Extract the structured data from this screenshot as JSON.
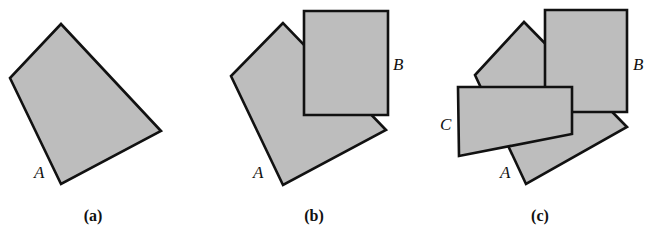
{
  "panels": [
    {
      "caption": "(a)",
      "shapes": [
        {
          "label": "A",
          "points": "61,24 10,78 61,184 161,131"
        }
      ],
      "labels": [
        {
          "text": "A",
          "x": 34,
          "y": 178
        }
      ]
    },
    {
      "caption": "(b)",
      "shapes": [
        {
          "label": "A",
          "points": "283,23 231,76 283,185 386,130"
        },
        {
          "label": "B",
          "points": "304,11 388,11 388,115 304,115"
        }
      ],
      "labels": [
        {
          "text": "A",
          "x": 253,
          "y": 178
        },
        {
          "text": "B",
          "x": 393,
          "y": 70
        }
      ]
    },
    {
      "caption": "(c)",
      "shapes": [
        {
          "label": "A",
          "points": "524,22 475,75 526,184 627,127"
        },
        {
          "label": "B",
          "points": "545,10 627,10 627,112 545,112"
        },
        {
          "label": "C",
          "points": "458,87 572,87 572,134 459,156"
        }
      ],
      "labels": [
        {
          "text": "A",
          "x": 500,
          "y": 178
        },
        {
          "text": "B",
          "x": 633,
          "y": 70
        },
        {
          "text": "C",
          "x": 440,
          "y": 130
        }
      ]
    }
  ],
  "colors": {
    "fill": "#bdbdbd",
    "stroke": "#111111"
  }
}
